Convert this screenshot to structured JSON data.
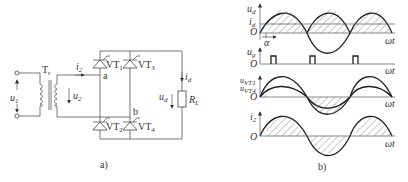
{
  "circuit": {
    "caption": "a)",
    "labels": {
      "u1": "u",
      "u1_sub": "1",
      "tr": "T",
      "tr_sub": "r",
      "i2": "i",
      "i2_sub": "2",
      "u2": "u",
      "u2_sub": "2",
      "node_a": "a",
      "node_b": "b",
      "vt1": "VT",
      "vt1_sub": "1",
      "vt2": "VT",
      "vt2_sub": "2",
      "vt3": "VT",
      "vt3_sub": "3",
      "vt4": "VT",
      "vt4_sub": "4",
      "id": "i",
      "id_sub": "d",
      "ud": "u",
      "ud_sub": "d",
      "rl": "R",
      "rl_sub": "L"
    }
  },
  "waveforms": {
    "caption": "b)",
    "plot1": {
      "y_label": "u",
      "y_sub": "d",
      "y2_label": "i",
      "y2_sub": "d",
      "origin": "O",
      "alpha": "α",
      "x_label": "ωt"
    },
    "plot2": {
      "y_label": "u",
      "y_sub": "g",
      "origin": "O",
      "x_label": "ωt"
    },
    "plot3": {
      "y_label1": "u",
      "y_sub1": "VT1",
      "y_label2": "u",
      "y_sub2": "VT4",
      "origin": "O",
      "x_label": "ωt"
    },
    "plot4": {
      "y_label": "i",
      "y_sub": "2",
      "origin": "O",
      "x_label": "ωt"
    }
  }
}
